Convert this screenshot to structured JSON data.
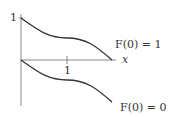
{
  "diagram": {
    "axes": {
      "x_label": "x",
      "y_tick_label": "1",
      "x_tick_label": "1",
      "axis_color": "#888888"
    },
    "curves": [
      {
        "name": "upper",
        "label": "F(0) = 1",
        "start_value": 1,
        "color": "#333333"
      },
      {
        "name": "lower",
        "label": "F(0) = 0",
        "start_value": 0,
        "color": "#333333"
      }
    ]
  }
}
